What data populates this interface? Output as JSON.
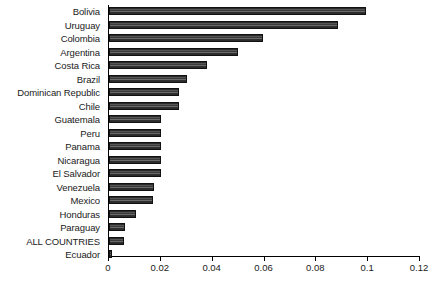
{
  "chart_data": {
    "type": "bar",
    "orientation": "horizontal",
    "title": "",
    "subtitle": "",
    "xlabel": "",
    "ylabel": "",
    "xlim": [
      0,
      0.12
    ],
    "xticks": [
      "0",
      "0.02",
      "0.04",
      "0.06",
      "0.08",
      "0.1",
      "0.12"
    ],
    "xtick_values": [
      0,
      0.02,
      0.04,
      0.06,
      0.08,
      0.1,
      0.12
    ],
    "grid": false,
    "legend": null,
    "legend_position": "none",
    "bar_color": "#333333",
    "axis_color": "#000000",
    "background": "#ffffff",
    "categories": [
      "Bolivia",
      "Uruguay",
      "Colombia",
      "Argentina",
      "Costa Rica",
      "Brazil",
      "Dominican Republic",
      "Chile",
      "Guatemala",
      "Peru",
      "Panama",
      "Nicaragua",
      "El Salvador",
      "Venezuela",
      "Mexico",
      "Honduras",
      "Paraguay",
      "ALL COUNTRIES",
      "Ecuador"
    ],
    "values": [
      0.099,
      0.0885,
      0.0596,
      0.0499,
      0.0379,
      0.0302,
      0.0272,
      0.0272,
      0.0202,
      0.0202,
      0.0202,
      0.0202,
      0.0202,
      0.0173,
      0.0168,
      0.0104,
      0.0062,
      0.0058,
      0.0013
    ]
  }
}
